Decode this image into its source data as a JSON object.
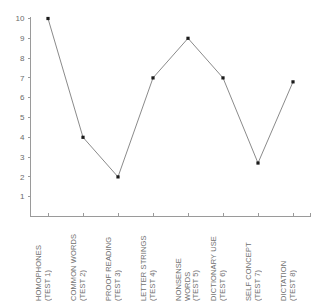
{
  "chart_data": {
    "type": "line",
    "title": "",
    "xlabel": "",
    "ylabel": "",
    "ylim": [
      0,
      10
    ],
    "yticks": [
      1,
      2,
      3,
      4,
      5,
      6,
      7,
      8,
      9,
      10
    ],
    "grid": false,
    "legend": null,
    "marker": "square",
    "line_color": "#7d7d7d",
    "marker_color": "#1a1a1a",
    "categories": [
      "HOMOPHONES\n(TEST 1)",
      "COMMON WORDS\n(TEST 2)",
      "PROOF READING\n(TEST 3)",
      "LETTER STRINGS\n(TEST 4)",
      "NONSENSE\nWORDS\n(TEST 5)",
      "DICTIONARY USE\n(TEST 6)",
      "SELF CONCEPT\n(TEST 7)",
      "DICTATION\n(TEST 8)"
    ],
    "values": [
      10,
      4,
      2,
      7,
      9,
      7,
      2.7,
      6.8
    ]
  }
}
